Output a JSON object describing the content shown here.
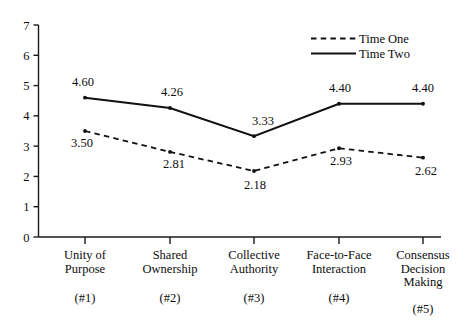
{
  "chart_data": {
    "type": "line",
    "title": "",
    "subtitle": "",
    "xlabel": "",
    "ylabel": "",
    "ylim": [
      0,
      7
    ],
    "y_ticks": [
      "0",
      "1",
      "2",
      "3",
      "4",
      "5",
      "6",
      "7"
    ],
    "grid": false,
    "legend_position": "top-right",
    "categories": [
      "Unity of Purpose",
      "Shared Ownership",
      "Collective Authority",
      "Face-to-Face Interaction",
      "Consensus Decision Making"
    ],
    "category_lines": [
      [
        "Unity of",
        "Purpose"
      ],
      [
        "Shared",
        "Ownership"
      ],
      [
        "Collective",
        "Authority"
      ],
      [
        "Face-to-Face",
        "Interaction"
      ],
      [
        "Consensus",
        "Decision",
        "Making"
      ]
    ],
    "category_numbers": [
      "(#1)",
      "(#2)",
      "(#3)",
      "(#4)",
      "(#5)"
    ],
    "series": [
      {
        "name": "Time One",
        "style": "dashed",
        "values": [
          3.5,
          2.81,
          2.18,
          2.93,
          2.62
        ],
        "labels": [
          "3.50",
          "2.81",
          "2.18",
          "2.93",
          "2.62"
        ]
      },
      {
        "name": "Time Two",
        "style": "solid",
        "values": [
          4.6,
          4.26,
          3.33,
          4.4,
          4.4
        ],
        "labels": [
          "4.60",
          "4.26",
          "3.33",
          "4.40",
          "4.40"
        ]
      }
    ]
  },
  "legend": {
    "items": [
      {
        "label": "Time One",
        "style": "dashed"
      },
      {
        "label": "Time Two",
        "style": "solid"
      }
    ]
  },
  "colors": {
    "line": "#111111",
    "axis": "#1a1a1a",
    "text": "#0d0d0d",
    "background": "#ffffff"
  }
}
